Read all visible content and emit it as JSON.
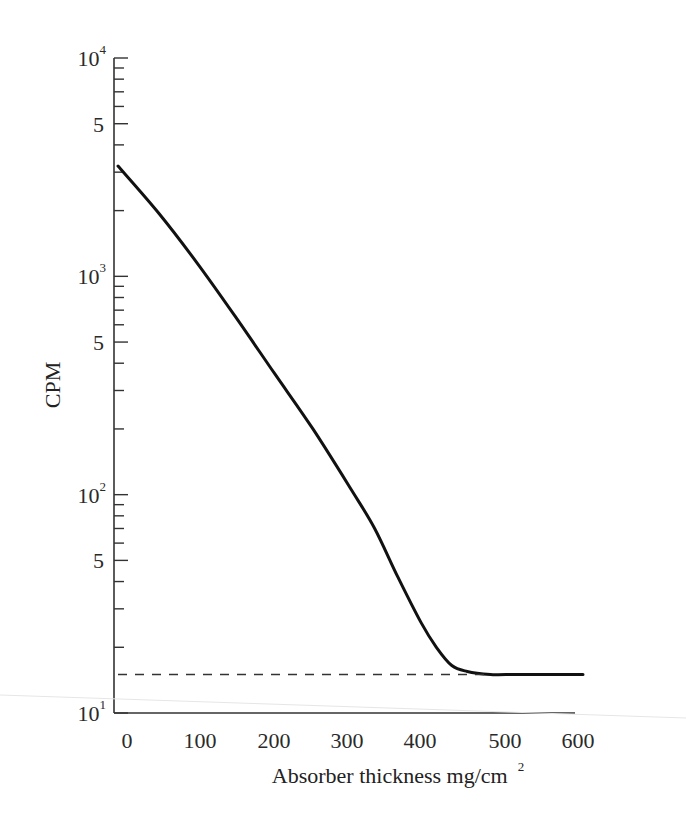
{
  "chart_data": {
    "type": "line",
    "title": "",
    "xlabel": "Absorber thickness mg/cm",
    "xlabel_superscript": "2",
    "ylabel": "CPM",
    "yscale": "log",
    "xlim": [
      0,
      600
    ],
    "ylim": [
      10,
      10000
    ],
    "grid": false,
    "legend": null,
    "x_ticks": [
      "0",
      "100",
      "200",
      "300",
      "400",
      "500",
      "600"
    ],
    "y_ticks": [
      {
        "base": "10",
        "exp": "4",
        "value": 10000
      },
      {
        "base": "5",
        "exp": "",
        "value": 5000
      },
      {
        "base": "10",
        "exp": "3",
        "value": 1000
      },
      {
        "base": "5",
        "exp": "",
        "value": 500
      },
      {
        "base": "10",
        "exp": "2",
        "value": 100
      },
      {
        "base": "5",
        "exp": "",
        "value": 50
      },
      {
        "base": "10",
        "exp": "1",
        "value": 10
      }
    ],
    "series": [
      {
        "name": "Absorption curve",
        "style": "solid",
        "x": [
          0,
          50,
          100,
          150,
          200,
          250,
          300,
          330,
          360,
          390,
          410,
          430,
          450,
          480,
          500,
          550,
          600
        ],
        "y": [
          3200,
          1950,
          1150,
          650,
          360,
          200,
          105,
          70,
          42,
          26,
          20,
          16.5,
          15.5,
          15,
          15,
          15,
          15
        ]
      },
      {
        "name": "Background level",
        "style": "dashed",
        "x": [
          0,
          480
        ],
        "y": [
          15,
          15
        ]
      }
    ]
  }
}
